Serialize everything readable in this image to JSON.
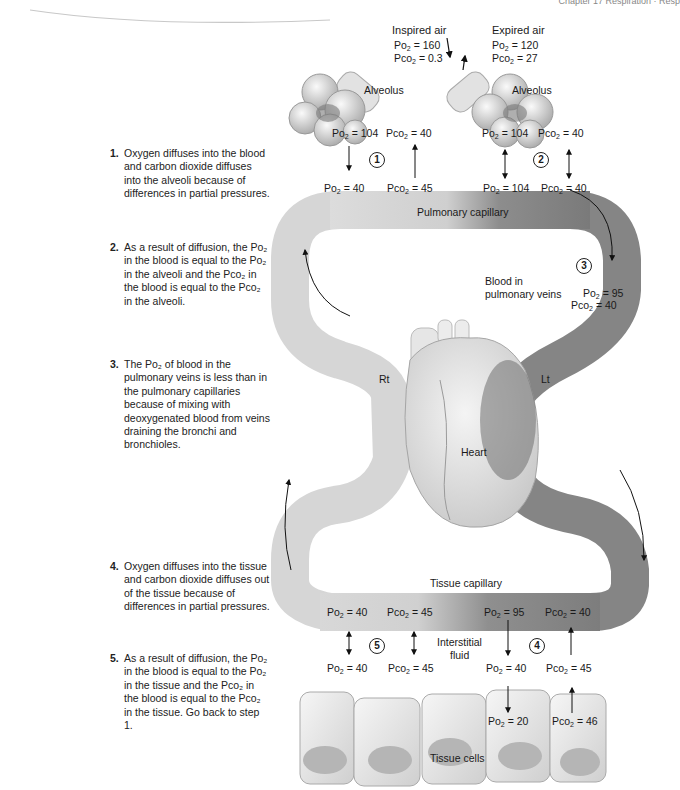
{
  "header": {
    "text": "Chapter 17 Respiration · Resp"
  },
  "air": {
    "inspired": {
      "title": "Inspired air",
      "po2": "Po2 = 160",
      "pco2": "Pco2 = 0.3",
      "po2_val": "160",
      "pco2_val": "0.3"
    },
    "expired": {
      "title": "Expired air",
      "po2": "Po2 = 120",
      "pco2": "Pco2 = 27",
      "po2_val": "120",
      "pco2_val": "27"
    }
  },
  "alveoli": {
    "left": {
      "label": "Alveolus",
      "po2_val": "104",
      "pco2_val": "40"
    },
    "right": {
      "label": "Alveolus",
      "po2_val": "104",
      "pco2_val": "40"
    }
  },
  "pulmonary_capillary": {
    "label": "Pulmonary capillary",
    "values": [
      {
        "gas": "O",
        "val": "40"
      },
      {
        "gas": "CO",
        "val": "45"
      },
      {
        "gas": "O",
        "val": "104"
      },
      {
        "gas": "CO",
        "val": "40"
      }
    ]
  },
  "pulmonary_veins": {
    "label_line1": "Blood in",
    "label_line2": "pulmonary veins",
    "po2_val": "95",
    "pco2_val": "40"
  },
  "heart": {
    "label": "Heart",
    "right": "Rt",
    "left": "Lt"
  },
  "tissue_capillary": {
    "label": "Tissue capillary",
    "values": [
      {
        "gas": "O",
        "val": "40"
      },
      {
        "gas": "CO",
        "val": "45"
      },
      {
        "gas": "O",
        "val": "95"
      },
      {
        "gas": "CO",
        "val": "40"
      }
    ]
  },
  "interstitial": {
    "label_line1": "Interstitial",
    "label_line2": "fluid",
    "values": [
      {
        "gas": "O",
        "val": "40"
      },
      {
        "gas": "CO",
        "val": "45"
      },
      {
        "gas": "O",
        "val": "40"
      },
      {
        "gas": "CO",
        "val": "45"
      }
    ]
  },
  "tissue_cells": {
    "label": "Tissue cells",
    "po2_val": "20",
    "pco2_val": "46"
  },
  "step_markers": [
    "1",
    "2",
    "3",
    "4",
    "5"
  ],
  "steps": [
    {
      "num": "1.",
      "text": "Oxygen diffuses into the blood and carbon dioxide diffuses into the alveoli because of differences in partial pressures."
    },
    {
      "num": "2.",
      "text": "As a result of diffusion, the Po₂ in the blood is equal to the Po₂ in the alveoli and the Pco₂ in the blood is equal to the Pco₂ in the alveoli."
    },
    {
      "num": "3.",
      "text": "The Po₂ of blood in the pulmonary veins is less than in the pulmonary capillaries because of mixing with deoxygenated blood from veins draining the bronchi and bronchioles."
    },
    {
      "num": "4.",
      "text": "Oxygen diffuses into the tissue and carbon dioxide diffuses out of the tissue because of differences in partial pressures."
    },
    {
      "num": "5.",
      "text": "As a result of diffusion, the Po₂ in the blood  is equal to the Po₂ in the tissue and the Pco₂ in the blood is equal to the Pco₂ in the tissue. Go back to step 1."
    }
  ],
  "colors": {
    "oxygenated": "#7a7a7a",
    "deoxygenated": "#d4d4d4",
    "tissue": "#dcdcdc"
  }
}
